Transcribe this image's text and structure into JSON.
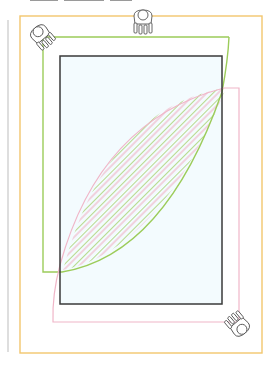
{
  "diagram": {
    "type": "floor-plan-clearance",
    "header_text_cropped": [
      "",
      "",
      ""
    ],
    "colors": {
      "page_rule": "#c8c8c8",
      "outer_clearance": "#f2c66d",
      "green_zone": "#9ccc5a",
      "pink_zone": "#f0b6c8",
      "table_outline": "#3a3a3a",
      "table_fill": "#f3fbfe",
      "hatch_green": "#9ccc5a",
      "hatch_pink": "#f0b6c8"
    },
    "shapes": {
      "page_rule": {
        "x": 8,
        "y1": 20,
        "y2": 352
      },
      "outer_clearance": {
        "x": 20,
        "y": 16,
        "w": 242,
        "h": 337
      },
      "table": {
        "x": 60,
        "y": 56,
        "w": 162,
        "h": 248
      },
      "green_zone": {
        "x": 43,
        "y": 37,
        "w": 186,
        "h": 235
      },
      "pink_zone": {
        "x": 53,
        "y": 88,
        "w": 186,
        "h": 234
      }
    },
    "figures": [
      {
        "name": "person-top-center",
        "x": 143,
        "y": 18,
        "rotation": 0
      },
      {
        "name": "person-top-left",
        "x": 40,
        "y": 32,
        "rotation": -40
      },
      {
        "name": "person-bottom-right",
        "x": 240,
        "y": 326,
        "rotation": 140
      }
    ]
  }
}
